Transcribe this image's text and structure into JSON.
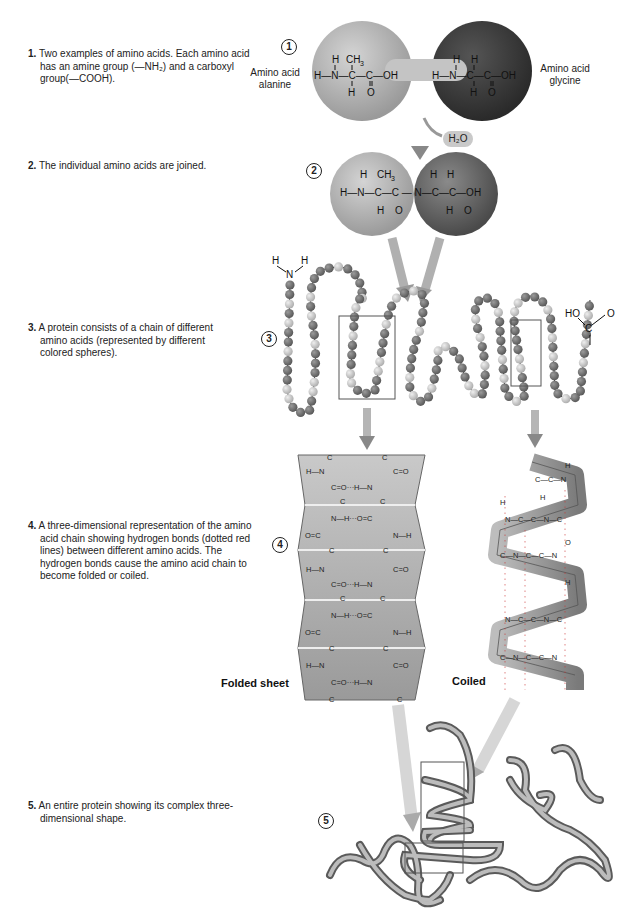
{
  "steps": [
    {
      "number": "1.",
      "text": "Two examples of amino acids. Each amino acid has an amine group (—NH₂) and a carboxyl group(—COOH)."
    },
    {
      "number": "2.",
      "text": "The individual amino acids are joined."
    },
    {
      "number": "3.",
      "text": "A protein consists of a chain of different amino acids (represented by different colored spheres)."
    },
    {
      "number": "4.",
      "text": "A three-dimensional representation of the amino acid chain showing hydrogen bonds (dotted red lines) between different amino acids. The hydrogen bonds cause the amino acid chain to become folded or coiled."
    },
    {
      "number": "5.",
      "text": "An entire protein showing its complex three-dimensional shape."
    }
  ],
  "markers": [
    "1",
    "2",
    "3",
    "4",
    "5"
  ],
  "labels": {
    "alanine": "Amino acid alanine",
    "alanine_line1": "Amino acid",
    "alanine_line2": "alanine",
    "glycine_line1": "Amino acid",
    "glycine_line2": "glycine",
    "water": "H₂O",
    "folded_sheet": "Folded sheet",
    "coiled": "Coiled"
  },
  "colors": {
    "alanine_sphere": "#b3b3b3",
    "glycine_sphere": "#3a3a3a",
    "dipeptide_glycine": "#6e6e6e",
    "arrow": "#a8a8a8",
    "bead_dark": "#7a7a7a",
    "bead_light": "#cfcfcf",
    "sheet": "#a9a9a9",
    "ribbon": "#8a8a8a"
  }
}
